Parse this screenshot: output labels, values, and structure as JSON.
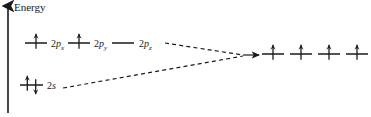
{
  "figure": {
    "axis": {
      "label": "Energy",
      "orientation": "vertical-up"
    },
    "left_group": {
      "name": "atomic-orbitals",
      "levels": [
        {
          "id": "2p",
          "energy_y": 43,
          "orbitals": [
            {
              "label_num": "2",
              "label_sym": "p",
              "label_sub": "x",
              "line_x1": 25,
              "line_x2": 47,
              "electrons": [
                "up"
              ],
              "label_x": 51,
              "label_y": 38
            },
            {
              "label_num": "2",
              "label_sym": "p",
              "label_sub": "y",
              "line_x1": 68,
              "line_x2": 90,
              "electrons": [
                "up"
              ],
              "label_x": 94,
              "label_y": 38
            },
            {
              "label_num": "2",
              "label_sym": "p",
              "label_sub": "z",
              "line_x1": 112,
              "line_x2": 134,
              "electrons": [],
              "label_x": 139,
              "label_y": 38
            }
          ]
        },
        {
          "id": "2s",
          "energy_y": 85,
          "orbitals": [
            {
              "label_num": "2",
              "label_sym": "s",
              "label_sub": "",
              "line_x1": 20,
              "line_x2": 43,
              "electrons": [
                "up",
                "down"
              ],
              "label_x": 47,
              "label_y": 80
            }
          ]
        }
      ]
    },
    "right_group": {
      "name": "hybrid-orbitals",
      "energy_y": 54,
      "orbitals": [
        {
          "line_x1": 262,
          "line_x2": 284,
          "electrons": [
            "up"
          ]
        },
        {
          "line_x1": 290,
          "line_x2": 312,
          "electrons": [
            "up"
          ]
        },
        {
          "line_x1": 318,
          "line_x2": 340,
          "electrons": [
            "up"
          ]
        },
        {
          "line_x1": 346,
          "line_x2": 368,
          "electrons": [
            "up"
          ]
        }
      ]
    },
    "connectors": [
      {
        "name": "p-to-hybrid",
        "x1": 165,
        "y1": 43,
        "x2": 243,
        "y2": 55
      },
      {
        "name": "s-to-hybrid",
        "x1": 63,
        "y1": 88,
        "x2": 243,
        "y2": 56
      },
      {
        "name": "hybrid-arrow",
        "x1": 243,
        "y1": 55,
        "x2": 259,
        "y2": 55
      }
    ],
    "colors": {
      "ink": "#1a1a1a",
      "background": "#ffffff"
    }
  }
}
